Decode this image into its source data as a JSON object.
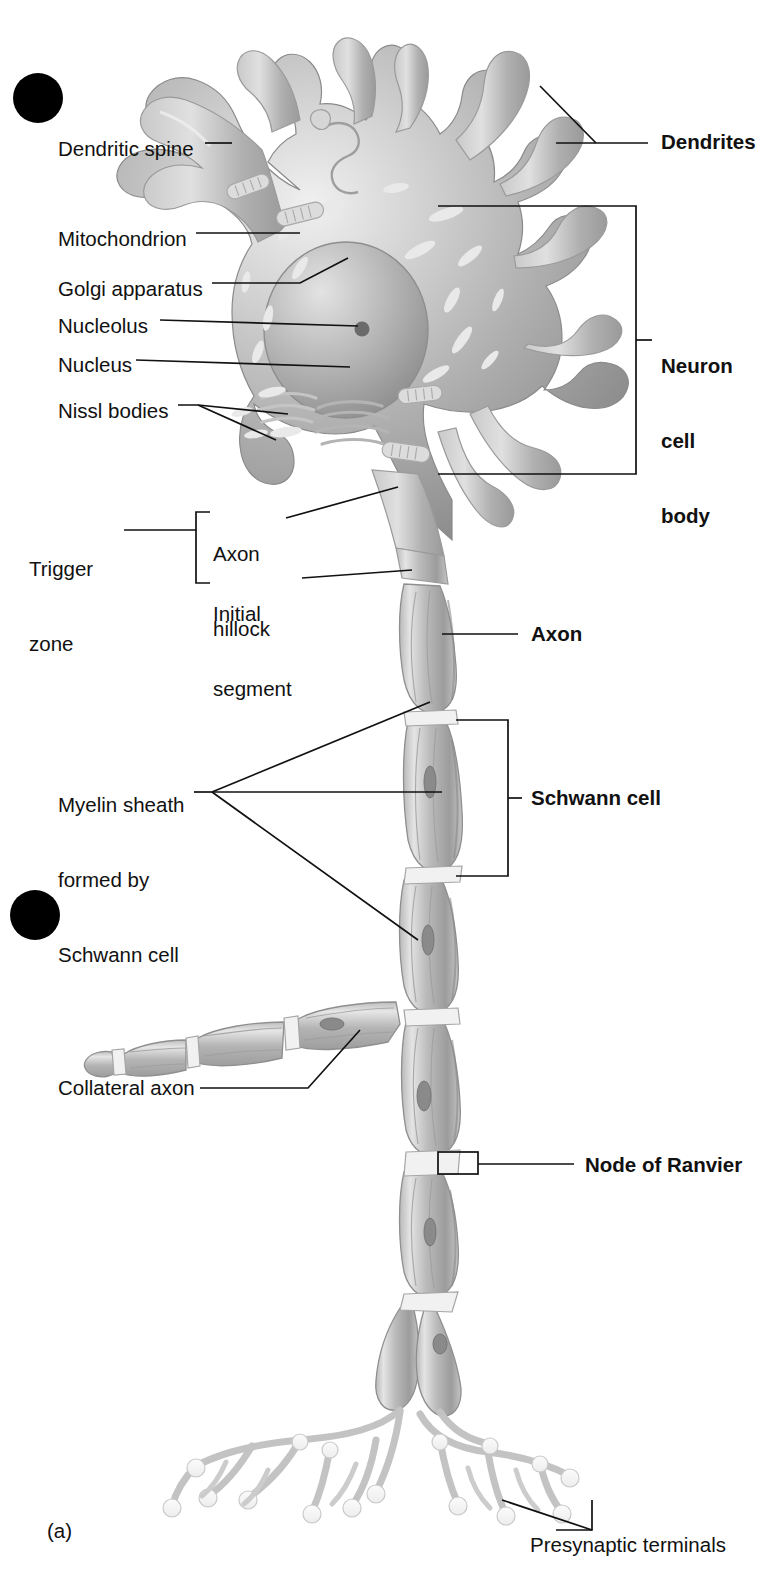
{
  "figure": {
    "panel_label": "(a)",
    "style": "grayscale textbook illustration"
  },
  "colors": {
    "ink": "#111111",
    "leader": "#111111",
    "soma_dark": "#8d8d8d",
    "soma_mid": "#a8a8a8",
    "soma_light": "#cfcfcf",
    "soma_highlight": "#f2f2f2",
    "myelin_dark": "#9a9a9a",
    "myelin_mid": "#b5b5b5",
    "myelin_light": "#d9d9d9",
    "terminal_fill": "#f4f4f4",
    "terminal_stroke": "#bdbdbd",
    "marker_dot": "#000000",
    "background": "#ffffff"
  },
  "left_labels": [
    {
      "id": "dendritic-spine",
      "text": "Dendritic spine",
      "x": 58,
      "y": 136
    },
    {
      "id": "mitochondrion",
      "text": "Mitochondrion",
      "x": 58,
      "y": 226
    },
    {
      "id": "golgi-apparatus",
      "text": "Golgi apparatus",
      "x": 58,
      "y": 276
    },
    {
      "id": "nucleolus",
      "text": "Nucleolus",
      "x": 58,
      "y": 313
    },
    {
      "id": "nucleus",
      "text": "Nucleus",
      "x": 58,
      "y": 352
    },
    {
      "id": "nissl-bodies",
      "text": "Nissl bodies",
      "x": 58,
      "y": 398
    },
    {
      "id": "collateral-axon",
      "text": "Collateral axon",
      "x": 58,
      "y": 1081
    }
  ],
  "left_multiline_labels": [
    {
      "id": "trigger-zone",
      "lines": [
        "Trigger",
        "zone"
      ],
      "x": 29,
      "y": 508
    },
    {
      "id": "axon-hillock",
      "lines": [
        "Axon",
        "hillock"
      ],
      "x": 213,
      "y": 493
    },
    {
      "id": "initial-segment",
      "lines": [
        "Initial",
        "segment"
      ],
      "x": 213,
      "y": 553
    },
    {
      "id": "myelin-sheath",
      "lines": [
        "Myelin sheath",
        "formed by",
        "Schwann cell"
      ],
      "x": 58,
      "y": 745
    }
  ],
  "right_labels": [
    {
      "id": "dendrites",
      "text": "Dendrites",
      "x": 661,
      "y": 129,
      "bold": true
    },
    {
      "id": "axon",
      "text": "Axon",
      "x": 531,
      "y": 625,
      "bold": true
    },
    {
      "id": "schwann-cell",
      "text": "Schwann cell",
      "x": 531,
      "y": 770,
      "bold": true
    },
    {
      "id": "node-of-ranvier",
      "text": "Node of Ranvier",
      "x": 585,
      "y": 1166,
      "bold": true
    }
  ],
  "right_multiline_labels": [
    {
      "id": "neuron-cell-body",
      "lines": [
        "Neuron",
        "cell",
        "body"
      ],
      "x": 661,
      "y": 303,
      "bold": true
    }
  ],
  "bottom_labels": [
    {
      "id": "presynaptic-terminals",
      "text": "Presynaptic terminals",
      "x": 530,
      "y": 1546
    }
  ],
  "markers": [
    {
      "id": "marker-dot-top",
      "cx": 38,
      "cy": 98,
      "r": 25
    },
    {
      "id": "marker-dot-middle",
      "cx": 35,
      "cy": 915,
      "r": 25
    }
  ],
  "structures": [
    "dendrites",
    "dendritic spines",
    "neuron cell body",
    "nucleus",
    "nucleolus",
    "Nissl bodies",
    "Golgi apparatus",
    "mitochondria",
    "axon hillock",
    "initial segment",
    "axon",
    "myelin sheath",
    "Schwann cells",
    "nodes of Ranvier",
    "collateral axon",
    "presynaptic terminals"
  ]
}
